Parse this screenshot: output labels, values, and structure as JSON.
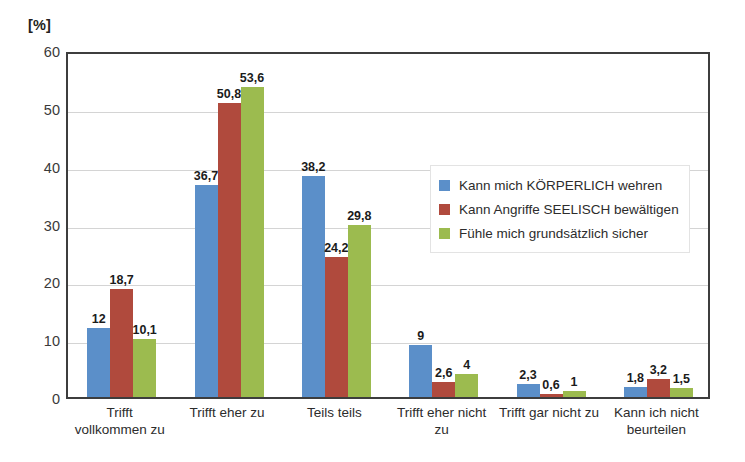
{
  "chart_data": {
    "type": "bar",
    "title": "",
    "subtitle": "",
    "xlabel": "",
    "ylabel": "[%]",
    "ylim": [
      0,
      60
    ],
    "yticks": [
      0,
      10,
      20,
      30,
      40,
      50,
      60
    ],
    "grid": true,
    "legend_position": "inside-right",
    "categories": [
      "Trifft vollkommen zu",
      "Trifft eher zu",
      "Teils teils",
      "Trifft eher nicht zu",
      "Trifft gar nicht zu",
      "Kann ich nicht beurteilen"
    ],
    "category_lines": [
      [
        "Trifft",
        "vollkommen zu"
      ],
      [
        "Trifft eher zu"
      ],
      [
        "Teils teils"
      ],
      [
        "Trifft eher nicht",
        "zu"
      ],
      [
        "Trifft gar nicht zu"
      ],
      [
        "Kann ich nicht",
        "beurteilen"
      ]
    ],
    "series": [
      {
        "name": "Kann mich KÖRPERLICH wehren",
        "color": "#5b8fc9",
        "values": [
          12,
          36.7,
          38.2,
          9,
          2.3,
          1.8
        ],
        "labels": [
          "12",
          "36,7",
          "38,2",
          "9",
          "2,3",
          "1,8"
        ]
      },
      {
        "name": "Kann Angriffe SEELISCH bewältigen",
        "color": "#b04a3d",
        "values": [
          18.7,
          50.8,
          24.2,
          2.6,
          0.6,
          3.2
        ],
        "labels": [
          "18,7",
          "50,8",
          "24,2",
          "2,6",
          "0,6",
          "3,2"
        ]
      },
      {
        "name": "Fühle mich grundsätzlich sicher",
        "color": "#9cbb4f",
        "values": [
          10.1,
          53.6,
          29.8,
          4,
          1,
          1.5
        ],
        "labels": [
          "10,1",
          "53,6",
          "29,8",
          "4",
          "1",
          "1,5"
        ]
      }
    ]
  }
}
